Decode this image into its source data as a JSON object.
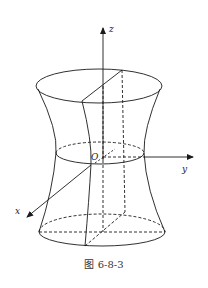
{
  "figure": {
    "caption": "图 6-8-3",
    "axes": {
      "x_label": "x",
      "y_label": "y",
      "z_label": "z",
      "origin_label": "O"
    },
    "colors": {
      "stroke": "#1a1a1a",
      "background": "#ffffff"
    }
  }
}
